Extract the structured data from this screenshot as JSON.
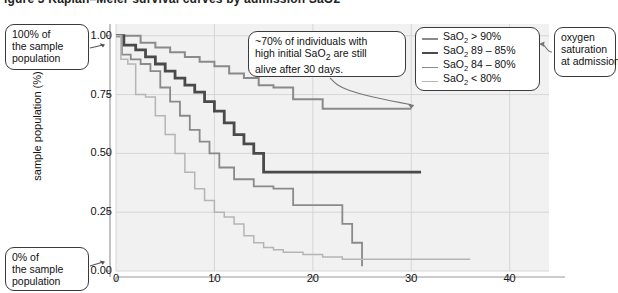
{
  "figure": {
    "top_partial_text": "igure 3  Kaplan–Meier survival curves by admission SaO2"
  },
  "callouts": [
    {
      "name": "top-left",
      "lines": [
        "100% of",
        "the sample",
        "population"
      ]
    },
    {
      "name": "bottom-left",
      "lines": [
        "0% of",
        "the sample",
        "population"
      ]
    },
    {
      "name": "annotation",
      "lines": [
        "~70% of individuals with",
        "high initial SaO2 are still",
        "alive after 30 days."
      ]
    },
    {
      "name": "legend-note",
      "lines": [
        "oxygen",
        "saturation",
        "at admission"
      ]
    }
  ],
  "legend": {
    "entries": [
      {
        "label": "SaO2 > 90%",
        "color": "#8a8a8a",
        "width": 2.0
      },
      {
        "label": "SaO2 89 – 85%",
        "color": "#4a4a4a",
        "width": 2.8
      },
      {
        "label": "SaO2 84 – 80%",
        "color": "#8a8a8a",
        "width": 1.8
      },
      {
        "label": "SaO2 < 80%",
        "color": "#b5b5b5",
        "width": 1.5
      }
    ]
  },
  "chart_data": {
    "type": "line",
    "title": "",
    "xlabel": "",
    "ylabel": "sample population (%)",
    "xlim": [
      0,
      44
    ],
    "ylim": [
      0.0,
      1.05
    ],
    "xticks": [
      0,
      10,
      20,
      30,
      40
    ],
    "yticks": [
      "0.00",
      "0.25",
      "0.50",
      "0.75",
      "1.00"
    ],
    "ytick_values": [
      0.0,
      0.25,
      0.5,
      0.75,
      1.0
    ],
    "grid": true,
    "legend_position": "top-right",
    "step": "post",
    "series": [
      {
        "name": "SaO2 > 90%",
        "color": "#8a8a8a",
        "width": 2.0,
        "x": [
          0,
          1,
          2.5,
          4,
          5.5,
          7,
          8.5,
          10,
          11.5,
          13,
          14.5,
          16,
          18,
          21,
          30
        ],
        "y": [
          1.0,
          1.0,
          0.97,
          0.95,
          0.93,
          0.91,
          0.89,
          0.87,
          0.84,
          0.82,
          0.79,
          0.78,
          0.73,
          0.69,
          0.69
        ]
      },
      {
        "name": "SaO2 89 - 85%",
        "color": "#4a4a4a",
        "width": 2.8,
        "x": [
          0,
          0.8,
          2,
          3,
          4,
          5,
          6,
          7,
          8,
          9,
          10,
          11,
          12,
          13,
          14,
          15,
          31
        ],
        "y": [
          1.0,
          0.96,
          0.94,
          0.91,
          0.88,
          0.85,
          0.82,
          0.79,
          0.76,
          0.72,
          0.68,
          0.63,
          0.58,
          0.54,
          0.5,
          0.42,
          0.42
        ]
      },
      {
        "name": "SaO2 84 - 80%",
        "color": "#8a8a8a",
        "width": 1.8,
        "x": [
          0,
          0.6,
          1.5,
          2.5,
          3.5,
          4.5,
          5.5,
          6.5,
          7.5,
          8.5,
          9.5,
          10.5,
          12,
          14,
          16,
          18,
          22,
          23,
          24,
          25
        ],
        "y": [
          1.0,
          0.92,
          0.9,
          0.88,
          0.85,
          0.78,
          0.72,
          0.66,
          0.6,
          0.55,
          0.5,
          0.44,
          0.39,
          0.36,
          0.35,
          0.28,
          0.28,
          0.2,
          0.12,
          0.02
        ]
      },
      {
        "name": "SaO2 < 80%",
        "color": "#b5b5b5",
        "width": 1.5,
        "x": [
          0,
          0.5,
          1.2,
          2,
          3,
          4,
          5,
          6,
          7,
          8,
          9,
          10,
          11,
          12,
          13,
          14,
          15,
          16,
          17,
          19,
          21,
          23,
          25,
          36
        ],
        "y": [
          1.0,
          0.9,
          0.88,
          0.75,
          0.74,
          0.66,
          0.58,
          0.5,
          0.42,
          0.35,
          0.3,
          0.25,
          0.23,
          0.2,
          0.15,
          0.12,
          0.1,
          0.09,
          0.08,
          0.07,
          0.06,
          0.05,
          0.05,
          0.05
        ]
      }
    ],
    "annotation_pointers": [
      {
        "from": "annotation",
        "to_series": "SaO2 > 90%",
        "to_x": 30,
        "to_y": 0.69
      },
      {
        "from": "top-left",
        "to_label": "1.00"
      },
      {
        "from": "bottom-left",
        "to_label": "0.00"
      },
      {
        "from": "legend-note",
        "to": "legend"
      }
    ]
  },
  "plot_area": {
    "left": 116,
    "top": 24,
    "right": 549,
    "bottom": 271,
    "background": "#f1f1f1",
    "grid_color": "#d6d6d6",
    "axis_color": "#9a9a9a"
  }
}
